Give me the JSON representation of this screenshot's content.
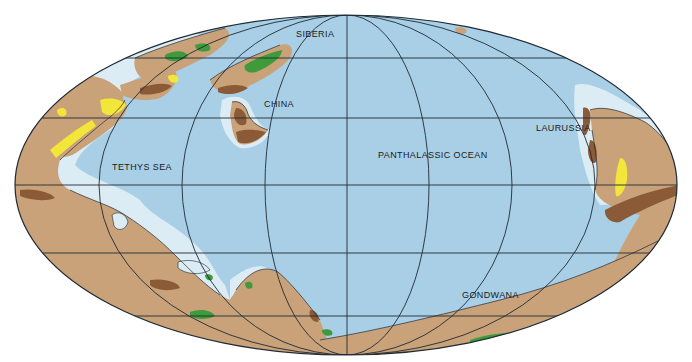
{
  "map": {
    "projection": "Mollweide (elliptical)",
    "colors": {
      "ocean": "#a9cfe6",
      "shelf": "#dcecf4",
      "land": "#c9a27a",
      "lowland_dark": "#8b5a36",
      "forest": "#3f9a3c",
      "desert": "#f3e63a",
      "grid": "#1f2a33",
      "background": "#ffffff"
    },
    "labels": [
      {
        "id": "siberia",
        "text": "SIBERIA",
        "x": 296,
        "y": 30
      },
      {
        "id": "china",
        "text": "CHINA",
        "x": 264,
        "y": 100
      },
      {
        "id": "tethys",
        "text": "TETHYS SEA",
        "x": 112,
        "y": 163
      },
      {
        "id": "panthalassic",
        "text": "PANTHALASSIC OCEAN",
        "x": 378,
        "y": 151
      },
      {
        "id": "laurussia",
        "text": "LAURUSSIA",
        "x": 536,
        "y": 124
      },
      {
        "id": "gondwana",
        "text": "GONDWANA",
        "x": 462,
        "y": 291
      }
    ],
    "legend_features": [
      {
        "name": "ocean",
        "description": "deep ocean"
      },
      {
        "name": "shelf",
        "description": "shallow sea / continental shelf"
      },
      {
        "name": "land",
        "description": "land"
      },
      {
        "name": "lowland_dark",
        "description": "mountains / highlands"
      },
      {
        "name": "forest",
        "description": "vegetation / coal swamps"
      },
      {
        "name": "desert",
        "description": "evaporites / arid zones"
      }
    ]
  }
}
